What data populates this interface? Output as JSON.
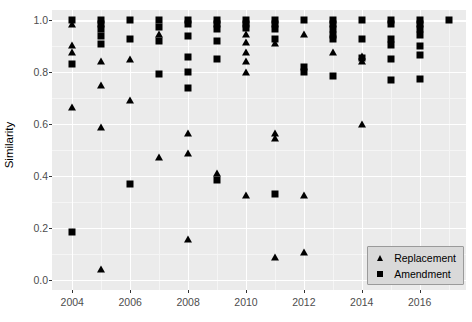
{
  "chart_data": {
    "type": "scatter",
    "title": "",
    "xlabel": "",
    "ylabel": "Similarity",
    "xlim": [
      2003.3,
      2017.6
    ],
    "ylim": [
      -0.04,
      1.04
    ],
    "grid": true,
    "legend_position": "bottom-right",
    "x_ticks": [
      2004,
      2006,
      2008,
      2010,
      2012,
      2014,
      2016
    ],
    "x_tick_labels": [
      "2004",
      "2006",
      "2008",
      "2010",
      "2012",
      "2014",
      "2016"
    ],
    "x_minor_ticks": [
      2005,
      2007,
      2009,
      2011,
      2013,
      2015,
      2017
    ],
    "y_ticks": [
      0.0,
      0.2,
      0.4,
      0.6,
      0.8,
      1.0
    ],
    "y_tick_labels": [
      "0.0",
      "0.2",
      "0.4",
      "0.6",
      "0.8",
      "1.0"
    ],
    "y_minor_ticks": [
      0.1,
      0.3,
      0.5,
      0.7,
      0.9
    ],
    "marker_color": "#000000",
    "panel_color": "#ebebeb",
    "grid_color": "#ffffff",
    "series": [
      {
        "name": "Replacement",
        "marker": "triangle",
        "points": [
          [
            2004,
            0.985
          ],
          [
            2004,
            0.905
          ],
          [
            2004,
            0.875
          ],
          [
            2004,
            0.665
          ],
          [
            2005,
            0.84
          ],
          [
            2005,
            0.75
          ],
          [
            2005,
            0.585
          ],
          [
            2005,
            0.04
          ],
          [
            2006,
            0.85
          ],
          [
            2006,
            0.69
          ],
          [
            2007,
            0.945
          ],
          [
            2007,
            0.47
          ],
          [
            2008,
            0.565
          ],
          [
            2008,
            0.485
          ],
          [
            2008,
            0.155
          ],
          [
            2009,
            0.41
          ],
          [
            2010,
            0.945
          ],
          [
            2010,
            0.915
          ],
          [
            2010,
            0.875
          ],
          [
            2010,
            0.84
          ],
          [
            2010,
            0.8
          ],
          [
            2010,
            0.325
          ],
          [
            2011,
            0.91
          ],
          [
            2011,
            0.565
          ],
          [
            2011,
            0.545
          ],
          [
            2011,
            0.085
          ],
          [
            2012,
            0.945
          ],
          [
            2012,
            0.325
          ],
          [
            2012,
            0.105
          ],
          [
            2013,
            0.875
          ],
          [
            2014,
            0.86
          ],
          [
            2014,
            0.84
          ],
          [
            2014,
            0.6
          ]
        ]
      },
      {
        "name": "Amendment",
        "marker": "square",
        "points": [
          [
            2004,
            1.0
          ],
          [
            2004,
            0.83
          ],
          [
            2004,
            0.185
          ],
          [
            2005,
            1.0
          ],
          [
            2005,
            0.985
          ],
          [
            2005,
            0.965
          ],
          [
            2005,
            0.94
          ],
          [
            2005,
            0.91
          ],
          [
            2006,
            1.0
          ],
          [
            2006,
            0.93
          ],
          [
            2006,
            0.37
          ],
          [
            2007,
            1.0
          ],
          [
            2007,
            0.975
          ],
          [
            2007,
            0.92
          ],
          [
            2007,
            0.795
          ],
          [
            2008,
            1.0
          ],
          [
            2008,
            0.985
          ],
          [
            2008,
            0.94
          ],
          [
            2008,
            0.86
          ],
          [
            2008,
            0.8
          ],
          [
            2008,
            0.74
          ],
          [
            2009,
            1.0
          ],
          [
            2009,
            0.985
          ],
          [
            2009,
            0.965
          ],
          [
            2009,
            0.92
          ],
          [
            2009,
            0.85
          ],
          [
            2009,
            0.385
          ],
          [
            2010,
            1.0
          ],
          [
            2010,
            0.985
          ],
          [
            2010,
            0.97
          ],
          [
            2011,
            1.0
          ],
          [
            2011,
            0.985
          ],
          [
            2011,
            0.965
          ],
          [
            2011,
            0.93
          ],
          [
            2011,
            0.33
          ],
          [
            2012,
            1.0
          ],
          [
            2012,
            0.82
          ],
          [
            2012,
            0.8
          ],
          [
            2013,
            1.0
          ],
          [
            2013,
            0.985
          ],
          [
            2013,
            0.965
          ],
          [
            2013,
            0.945
          ],
          [
            2013,
            0.93
          ],
          [
            2013,
            0.785
          ],
          [
            2014,
            1.0
          ],
          [
            2014,
            0.93
          ],
          [
            2014,
            0.855
          ],
          [
            2015,
            1.0
          ],
          [
            2015,
            0.985
          ],
          [
            2015,
            0.93
          ],
          [
            2015,
            0.905
          ],
          [
            2015,
            0.85
          ],
          [
            2015,
            0.77
          ],
          [
            2016,
            1.0
          ],
          [
            2016,
            0.985
          ],
          [
            2016,
            0.965
          ],
          [
            2016,
            0.945
          ],
          [
            2016,
            0.9
          ],
          [
            2016,
            0.865
          ],
          [
            2016,
            0.775
          ],
          [
            2017,
            1.0
          ]
        ]
      }
    ]
  },
  "legend": {
    "items": [
      {
        "label": "Replacement",
        "marker": "triangle"
      },
      {
        "label": "Amendment",
        "marker": "square"
      }
    ]
  }
}
